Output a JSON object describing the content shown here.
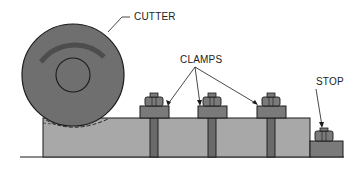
{
  "diagram": {
    "type": "milling-setup-side-view",
    "labels": {
      "cutter": "CUTTER",
      "clamps": "CLAMPS",
      "stop": "STOP"
    },
    "colors": {
      "cutter_fill": "#6f6f6f",
      "cutter_arc": "#4d4d4d",
      "workpiece_fill": "#a8a8a8",
      "clamp_fill": "#7a7a7a",
      "bolt_fill": "#6a6a6a",
      "outline": "#1a1a1a",
      "background": "#ffffff"
    },
    "components": [
      {
        "name": "cutter",
        "description": "rotating circular cutter with rotation arc and arbor hole"
      },
      {
        "name": "workpiece",
        "description": "rectangular workpiece on table"
      },
      {
        "name": "clamp",
        "count": 3
      },
      {
        "name": "stop",
        "count": 1
      }
    ]
  }
}
